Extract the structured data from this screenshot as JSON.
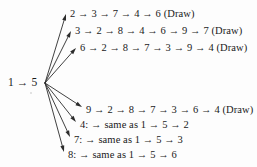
{
  "figure": {
    "type": "tree-diagram",
    "root": {
      "label": "1 → 5",
      "x": 8,
      "y": 76
    },
    "fan_origin": {
      "x": 45,
      "y": 83
    },
    "branches": [
      {
        "id": "branch-2",
        "label": "2 → 3 → 7 → 4 → 6 (Draw)",
        "x": 70,
        "y": 8,
        "arrow_tip": {
          "x": 66,
          "y": 14
        }
      },
      {
        "id": "branch-3",
        "label": "3 → 2 → 8 → 4 → 6 → 9 → 7 (Draw)",
        "x": 75,
        "y": 25,
        "arrow_tip": {
          "x": 71,
          "y": 31
        }
      },
      {
        "id": "branch-6",
        "label": "6 → 2 → 8 → 7 → 3 → 9 → 4 (Draw)",
        "x": 80,
        "y": 42,
        "arrow_tip": {
          "x": 76,
          "y": 48
        }
      },
      {
        "id": "branch-9",
        "label": "9 → 2 → 8 → 7 → 3 → 6 → 4 (Draw)",
        "x": 86,
        "y": 104,
        "arrow_tip": {
          "x": 82,
          "y": 107
        }
      },
      {
        "id": "branch-4",
        "label": "4: → same as 1 → 5 → 2",
        "x": 80,
        "y": 119,
        "arrow_tip": {
          "x": 76,
          "y": 122
        }
      },
      {
        "id": "branch-7",
        "label": "7: → same as 1 → 5 → 3",
        "x": 74,
        "y": 134,
        "arrow_tip": {
          "x": 70,
          "y": 137
        }
      },
      {
        "id": "branch-8",
        "label": "8: → same as 1 → 5 → 6",
        "x": 68,
        "y": 149,
        "arrow_tip": {
          "x": 64,
          "y": 152
        }
      }
    ],
    "style": {
      "edge_color": "#2b2b2b",
      "text_color": "#1a1a1a",
      "background": "#fdfdfd"
    }
  }
}
